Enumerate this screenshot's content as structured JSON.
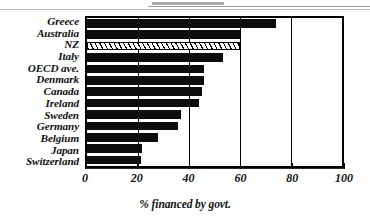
{
  "chart_data": {
    "type": "bar",
    "orientation": "horizontal",
    "title": "",
    "xlabel": "% financed by govt.",
    "ylabel": "",
    "xlim": [
      0,
      100
    ],
    "xticks": [
      0,
      20,
      40,
      60,
      80,
      100
    ],
    "xtick_labels": [
      "0",
      "20",
      "40",
      "60",
      "80",
      "100"
    ],
    "grid": "vertical gridlines at 20, 40, 60, 80",
    "legend": "none",
    "highlight_category": "NZ",
    "highlight_style": "white bar with diagonal hatching and black outline",
    "bar_color": "#0d0d0d",
    "categories": [
      "Greece",
      "Australia",
      "NZ",
      "Italy",
      "OECD ave.",
      "Denmark",
      "Canada",
      "Ireland",
      "Sweden",
      "Germany",
      "Belgium",
      "Japan",
      "Switzerland"
    ],
    "values": [
      74,
      60,
      60,
      53.5,
      46,
      46,
      45,
      44,
      37,
      35.5,
      28,
      21.5,
      21
    ]
  },
  "axis": {
    "x_title": "% financed by govt."
  }
}
